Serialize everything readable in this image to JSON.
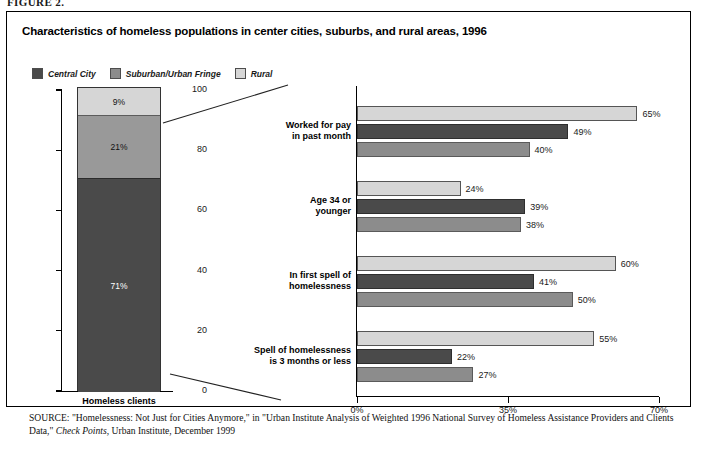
{
  "figure": {
    "label": "FIGURE 2."
  },
  "title": "Characteristics of homeless populations in center cities, suburbs, and rural areas, 1996",
  "legend": {
    "items": [
      {
        "label": "Central City",
        "color": "#4a4a4a",
        "key": "central"
      },
      {
        "label": "Suburban/Urban Fringe",
        "color": "#8c8c8c",
        "key": "suburb"
      },
      {
        "label": "Rural",
        "color": "#d6d6d6",
        "key": "rural"
      }
    ]
  },
  "source": {
    "prefix": "SOURCE:",
    "line1_a": " \"Homelessness: Not Just for Cities Anymore,\" in \"Urban Institute Analysis of Weighted 1996 National Survey of Homeless Assistance Providers and Clients Data,\" ",
    "italic": "Check Points",
    "line1_b": ", Urban Institute, December 1999"
  },
  "chart_data": [
    {
      "type": "bar",
      "subtype": "stacked-column",
      "title": "",
      "categories": [
        "Homeless clients"
      ],
      "xlabel": "",
      "ylabel": "",
      "ylim": [
        0,
        100
      ],
      "yticks": [
        0,
        20,
        40,
        60,
        80,
        100
      ],
      "ytick_labels": [
        "0",
        "20",
        "40",
        "60",
        "80",
        "100"
      ],
      "grid": false,
      "legend_position": "top-left",
      "series": [
        {
          "name": "Central City",
          "values": [
            71
          ],
          "labels": [
            "71%"
          ],
          "color": "#4a4a4a"
        },
        {
          "name": "Suburban/Urban Fringe",
          "values": [
            21
          ],
          "labels": [
            "21%"
          ],
          "color": "#999999"
        },
        {
          "name": "Rural",
          "values": [
            9
          ],
          "labels": [
            "9%"
          ],
          "color": "#d6d6d6"
        }
      ]
    },
    {
      "type": "bar",
      "subtype": "grouped-horizontal",
      "title": "",
      "categories": [
        "Worked for pay\nin past month",
        "Age 34 or\nyounger",
        "In first spell of\nhomelessness",
        "Spell of homelessness\nis 3 months or less"
      ],
      "category_lines": [
        [
          "Worked for pay",
          "in past month"
        ],
        [
          "Age 34 or",
          "younger"
        ],
        [
          "In first spell of",
          "homelessness"
        ],
        [
          "Spell of homelessness",
          "is 3 months or less"
        ]
      ],
      "xlabel": "",
      "ylabel": "",
      "xlim": [
        0,
        70
      ],
      "xticks": [
        0,
        35,
        70
      ],
      "xtick_labels": [
        "0%",
        "35%",
        "70%"
      ],
      "grid": false,
      "bar_order_top_to_bottom": [
        "Rural",
        "Central City",
        "Suburban/Urban Fringe"
      ],
      "series": [
        {
          "name": "Rural",
          "color": "#d6d6d6",
          "values": [
            65,
            24,
            60,
            55
          ],
          "labels": [
            "65%",
            "24%",
            "60%",
            "55%"
          ]
        },
        {
          "name": "Central City",
          "color": "#4a4a4a",
          "values": [
            49,
            39,
            41,
            22
          ],
          "labels": [
            "49%",
            "39%",
            "41%",
            "22%"
          ]
        },
        {
          "name": "Suburban/Urban Fringe",
          "color": "#8c8c8c",
          "values": [
            40,
            38,
            50,
            27
          ],
          "labels": [
            "40%",
            "38%",
            "50%",
            "27%"
          ]
        }
      ]
    }
  ]
}
